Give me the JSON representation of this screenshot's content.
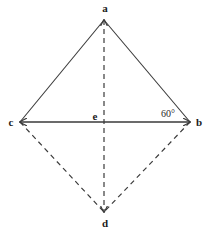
{
  "figure": {
    "canvas": {
      "width": 208,
      "height": 235,
      "background": "#ffffff"
    },
    "stroke_color": "#3a3a3a",
    "label_color": "#1b1b1b",
    "vertices": [
      {
        "id": "a",
        "label": "a",
        "x": 104,
        "y": 20,
        "label_x": 105,
        "label_y": 8
      },
      {
        "id": "c",
        "label": "c",
        "x": 20,
        "y": 122,
        "label_x": 11,
        "label_y": 122
      },
      {
        "id": "e",
        "label": "e",
        "x": 104,
        "y": 122,
        "label_x": 95,
        "label_y": 116
      },
      {
        "id": "b",
        "label": "b",
        "x": 190,
        "y": 122,
        "label_x": 199,
        "label_y": 122
      },
      {
        "id": "d",
        "label": "d",
        "x": 104,
        "y": 212,
        "label_x": 105,
        "label_y": 223
      }
    ],
    "edges": [
      {
        "id": "ca",
        "from": "c",
        "to": "a",
        "style": "solid",
        "arrow_start": false,
        "arrow_end": false
      },
      {
        "id": "ab",
        "from": "a",
        "to": "b",
        "style": "solid",
        "arrow_start": false,
        "arrow_end": false
      },
      {
        "id": "cb",
        "from": "c",
        "to": "b",
        "style": "solid",
        "arrow_start": true,
        "arrow_end": true
      },
      {
        "id": "ad",
        "from": "a",
        "to": "d",
        "style": "dashed",
        "arrow_start": true,
        "arrow_end": true
      },
      {
        "id": "cd",
        "from": "c",
        "to": "d",
        "style": "dashed",
        "arrow_start": false,
        "arrow_end": false
      },
      {
        "id": "bd",
        "from": "b",
        "to": "d",
        "style": "dashed",
        "arrow_start": false,
        "arrow_end": false
      }
    ],
    "angles": [
      {
        "id": "angle-abc",
        "at_vertex": "b",
        "value": "60",
        "unit": "°",
        "text": "60°",
        "x": 168,
        "y": 114
      }
    ]
  }
}
